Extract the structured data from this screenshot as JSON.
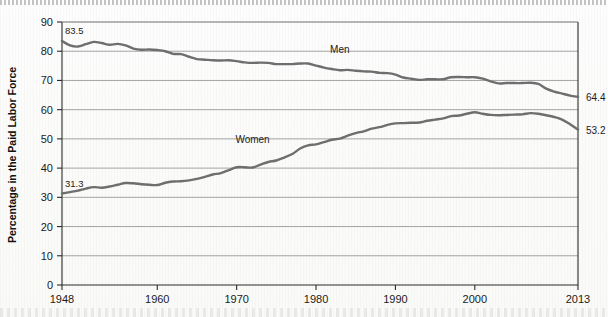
{
  "figure": {
    "y_axis_title": "Percentage in the Paid Labor Force"
  },
  "chart_data": {
    "type": "line",
    "title": "",
    "subtitle": "",
    "xlabel": "",
    "ylabel": "Percentage in the Paid Labor Force",
    "xlim": [
      1948,
      2013
    ],
    "ylim": [
      0,
      90
    ],
    "y_ticks": [
      0,
      10,
      20,
      30,
      40,
      50,
      60,
      70,
      80,
      90
    ],
    "x_ticks": [
      1948,
      1960,
      1970,
      1980,
      1990,
      2000,
      2013
    ],
    "x_tick_labels": [
      "1948",
      "1960",
      "1970",
      "1980",
      "1990",
      "2000",
      "2013"
    ],
    "y_tick_labels": [
      "0",
      "10",
      "20",
      "30",
      "40",
      "50",
      "60",
      "70",
      "80",
      "90"
    ],
    "grid": "horizontal",
    "legend": "inline-series-labels",
    "annotations": [
      {
        "name": "men-start-value",
        "text": "83.5",
        "x": 1948,
        "y": 83.5,
        "position": "above-left"
      },
      {
        "name": "women-start-value",
        "text": "31.3",
        "x": 1948,
        "y": 31.3,
        "position": "above-left"
      },
      {
        "name": "men-end-value",
        "text": "64.4",
        "x": 2013,
        "y": 64.4,
        "position": "right"
      },
      {
        "name": "women-end-value",
        "text": "53.2",
        "x": 2013,
        "y": 53.2,
        "position": "right"
      },
      {
        "name": "men-series-label",
        "text": "Men",
        "x": 1983,
        "y": 76.5,
        "position": "above"
      },
      {
        "name": "women-series-label",
        "text": "Women",
        "x": 1972,
        "y": 46.0,
        "position": "above"
      }
    ],
    "x": [
      1948,
      1949,
      1950,
      1951,
      1952,
      1953,
      1954,
      1955,
      1956,
      1957,
      1958,
      1959,
      1960,
      1961,
      1962,
      1963,
      1964,
      1965,
      1966,
      1967,
      1968,
      1969,
      1970,
      1971,
      1972,
      1973,
      1974,
      1975,
      1976,
      1977,
      1978,
      1979,
      1980,
      1981,
      1982,
      1983,
      1984,
      1985,
      1986,
      1987,
      1988,
      1989,
      1990,
      1991,
      1992,
      1993,
      1994,
      1995,
      1996,
      1997,
      1998,
      1999,
      2000,
      2001,
      2002,
      2003,
      2004,
      2005,
      2006,
      2007,
      2008,
      2009,
      2010,
      2011,
      2012,
      2013
    ],
    "series": [
      {
        "name": "Men",
        "color": "#6e6e6e",
        "values": [
          83.5,
          82.0,
          81.6,
          82.4,
          83.2,
          82.8,
          82.2,
          82.5,
          82.0,
          80.9,
          80.5,
          80.6,
          80.4,
          80.0,
          79.1,
          79.0,
          78.1,
          77.3,
          77.1,
          76.9,
          76.8,
          76.9,
          76.6,
          76.2,
          76.0,
          76.1,
          76.0,
          75.6,
          75.6,
          75.6,
          75.8,
          75.8,
          75.1,
          74.4,
          73.9,
          73.5,
          73.6,
          73.3,
          73.1,
          73.0,
          72.6,
          72.5,
          72.0,
          71.0,
          70.6,
          70.2,
          70.4,
          70.4,
          70.4,
          71.1,
          71.2,
          71.1,
          71.1,
          70.6,
          69.7,
          69.0,
          69.1,
          69.1,
          69.1,
          69.2,
          68.8,
          67.2,
          66.2,
          65.5,
          64.8,
          64.4
        ]
      },
      {
        "name": "Women",
        "color": "#6e6e6e",
        "values": [
          31.3,
          31.8,
          32.3,
          33.0,
          33.5,
          33.3,
          33.7,
          34.3,
          34.9,
          34.8,
          34.5,
          34.3,
          34.2,
          35.0,
          35.4,
          35.5,
          35.8,
          36.3,
          37.0,
          37.8,
          38.3,
          39.3,
          40.3,
          40.3,
          40.2,
          41.2,
          42.1,
          42.6,
          43.6,
          44.8,
          46.7,
          47.8,
          48.1,
          48.9,
          49.7,
          50.1,
          51.1,
          52.0,
          52.6,
          53.5,
          54.0,
          54.8,
          55.3,
          55.4,
          55.5,
          55.6,
          56.2,
          56.6,
          57.0,
          57.8,
          58.0,
          58.6,
          59.1,
          58.6,
          58.2,
          58.1,
          58.2,
          58.3,
          58.4,
          58.8,
          58.6,
          58.1,
          57.5,
          56.6,
          55.0,
          53.2
        ]
      }
    ]
  }
}
